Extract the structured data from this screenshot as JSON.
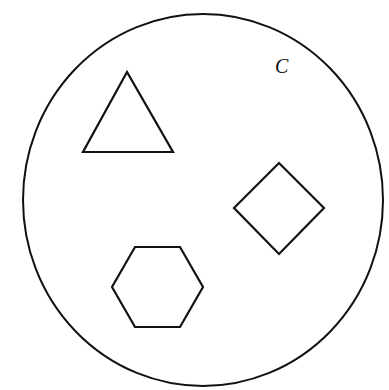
{
  "diagram": {
    "set_label": "C",
    "stroke_color": "#111111",
    "background_color": "#ffffff",
    "container": {
      "shape": "circle",
      "cx": 203,
      "cy": 200,
      "rx": 180,
      "ry": 186
    },
    "shapes": [
      {
        "name": "triangle",
        "points": "127,72 83,152 173,152"
      },
      {
        "name": "diamond",
        "points": "279,163 324,208 279,254 234,208"
      },
      {
        "name": "hexagon",
        "points": "135,247 180,247 203,287 180,327 135,327 112,287"
      }
    ],
    "label_position": {
      "x": 275,
      "y": 73
    }
  }
}
